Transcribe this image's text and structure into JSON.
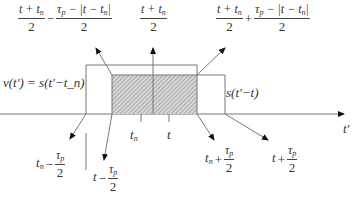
{
  "diagram": {
    "type": "convolution-overlap",
    "axis": {
      "label": "t'"
    },
    "pulses": [
      {
        "name": "received-pulse",
        "label": "v(t') = s(t'−t_n)"
      },
      {
        "name": "reference-pulse",
        "label": "s(t'−t)"
      }
    ],
    "ticks": [
      {
        "name": "t_n",
        "label": "t",
        "sub": "n"
      },
      {
        "name": "t",
        "label": "t",
        "sub": ""
      }
    ],
    "annotations": {
      "top_left": {
        "a_num": "t + t",
        "a_sub": "n",
        "a_den": "2",
        "op": "−",
        "b_num_pre": "τ",
        "b_sub": "p",
        "b_num_post": " − |t − t",
        "b_sub2": "n",
        "b_tail": "|",
        "b_den": "2"
      },
      "top_center": {
        "num": "t + t",
        "sub": "n",
        "den": "2"
      },
      "top_right": {
        "a_num": "t + t",
        "a_sub": "n",
        "a_den": "2",
        "op": "+",
        "b_num_pre": "τ",
        "b_sub": "p",
        "b_num_post": " − |t − t",
        "b_sub2": "n",
        "b_tail": "|",
        "b_den": "2"
      },
      "bottom_1": {
        "pre": "t",
        "pre_sub": "n",
        "op": "−",
        "num": "τ",
        "num_sub": "p",
        "den": "2"
      },
      "bottom_2": {
        "pre": "t",
        "pre_sub": "",
        "op": "−",
        "num": "τ",
        "num_sub": "p",
        "den": "2"
      },
      "bottom_3": {
        "pre": "t",
        "pre_sub": "n",
        "op": "+",
        "num": "τ",
        "num_sub": "p",
        "den": "2"
      },
      "bottom_4": {
        "pre": "t",
        "pre_sub": "",
        "op": "+",
        "num": "τ",
        "num_sub": "p",
        "den": "2"
      }
    },
    "colors": {
      "line": "#777777",
      "hatch": "#9a9a9a",
      "arrow": "#111111"
    }
  }
}
